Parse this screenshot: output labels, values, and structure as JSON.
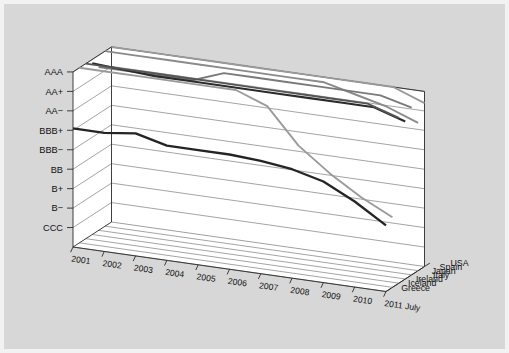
{
  "figure": {
    "background_color": "#d7d7d7",
    "plot_face_color": "#ffffff",
    "border_color": "#f2f2f2"
  },
  "chart_data": {
    "type": "line",
    "projection": "3d",
    "title": "",
    "subtitle": "",
    "xlabel": "",
    "ylabel": "",
    "zlabel": "",
    "grid": true,
    "legend_position": "depth-axis-right",
    "x": [
      "2001",
      "2002",
      "2003",
      "2004",
      "2005",
      "2006",
      "2007",
      "2008",
      "2009",
      "2010",
      "2011 July"
    ],
    "categories": [
      "2001",
      "2002",
      "2003",
      "2004",
      "2005",
      "2006",
      "2007",
      "2008",
      "2009",
      "2010",
      "2011 July"
    ],
    "y_tick_labels": [
      "AAA",
      "AA+",
      "AA−",
      "BBB+",
      "BBB−",
      "BB",
      "B+",
      "B−",
      "CCC"
    ],
    "y_tick_values": [
      9,
      8,
      7,
      6,
      5,
      4,
      3,
      2,
      1
    ],
    "ylim": [
      0,
      9
    ],
    "z_tick_labels": [
      "USA",
      "Spain",
      "Japan",
      "Italy",
      "Ireland",
      "Iceland",
      "Greece"
    ],
    "series": [
      {
        "name": "USA",
        "z_index": 0,
        "color": "#999999",
        "stroke_width": 1.9,
        "values": [
          9,
          9,
          9,
          9,
          9,
          9,
          9,
          9,
          9,
          9,
          8.4
        ]
      },
      {
        "name": "Spain",
        "z_index": 1,
        "color": "#8a8a8a",
        "stroke_width": 1.9,
        "values": [
          9,
          9,
          9,
          9,
          9,
          9,
          9,
          9,
          8.6,
          8.2,
          7.6
        ]
      },
      {
        "name": "Japan",
        "z_index": 2,
        "color": "#7a7a7a",
        "stroke_width": 1.9,
        "values": [
          8.4,
          8.4,
          8.4,
          8.4,
          9,
          9,
          9,
          9,
          9,
          9,
          8.6
        ]
      },
      {
        "name": "Italy",
        "z_index": 3,
        "color": "#2b2b2b",
        "stroke_width": 2.1,
        "values": [
          8.8,
          8.7,
          8.6,
          8.6,
          8.6,
          8.6,
          8.6,
          8.6,
          8.6,
          8.6,
          8.1
        ]
      },
      {
        "name": "Ireland",
        "z_index": 4,
        "color": "#555555",
        "stroke_width": 1.9,
        "values": [
          9,
          9,
          9,
          9,
          9,
          9,
          9,
          9,
          9,
          9,
          8.5
        ]
      },
      {
        "name": "Iceland",
        "z_index": 5,
        "color": "#9a9a9a",
        "stroke_width": 1.9,
        "values": [
          9,
          9,
          9,
          9,
          9,
          9,
          8.4,
          6.6,
          5.4,
          4.4,
          3.6
        ]
      },
      {
        "name": "Greece",
        "z_index": 6,
        "color": "#242424",
        "stroke_width": 2.3,
        "values": [
          6.1,
          6.1,
          6.3,
          5.9,
          5.9,
          5.9,
          5.8,
          5.6,
          5.2,
          4.4,
          3.4
        ]
      }
    ],
    "annotations": []
  }
}
